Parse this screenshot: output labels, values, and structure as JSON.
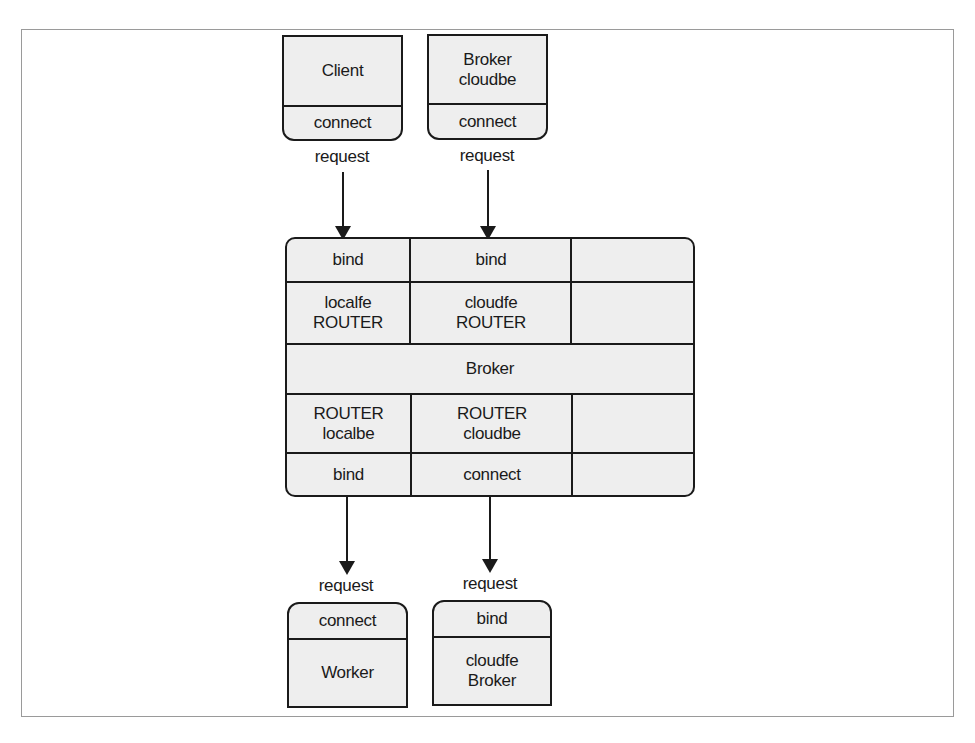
{
  "top_nodes": [
    {
      "main": "Client",
      "socket": "connect",
      "edge_label": "request"
    },
    {
      "main": "Broker\ncloudbe",
      "socket": "connect",
      "edge_label": "request"
    }
  ],
  "broker": {
    "row1": [
      "bind",
      "bind",
      ""
    ],
    "row2": [
      "localfe\nROUTER",
      "cloudfe\nROUTER",
      ""
    ],
    "center": "Broker",
    "row4": [
      "ROUTER\nlocalbe",
      "ROUTER\ncloudbe",
      ""
    ],
    "row5": [
      "bind",
      "connect",
      ""
    ]
  },
  "bottom_nodes": [
    {
      "socket": "connect",
      "main": "Worker",
      "edge_label": "request"
    },
    {
      "socket": "bind",
      "main": "cloudfe\nBroker",
      "edge_label": "request"
    }
  ]
}
